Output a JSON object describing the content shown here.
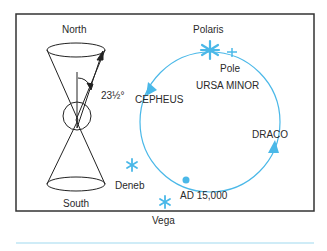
{
  "diagram": {
    "labels": {
      "north": "North",
      "south": "South",
      "angle": "23½°",
      "polaris": "Polaris",
      "pole": "Pole",
      "ursa_minor": "URSA MINOR",
      "cepheus": "CEPHEUS",
      "draco": "DRACO",
      "deneb": "Deneb",
      "vega": "Vega",
      "ad": "AD 15,000"
    },
    "colors": {
      "accent": "#4ab8e8",
      "line": "#222222",
      "frame": "#333333",
      "underline": "#bfe6f4"
    }
  }
}
